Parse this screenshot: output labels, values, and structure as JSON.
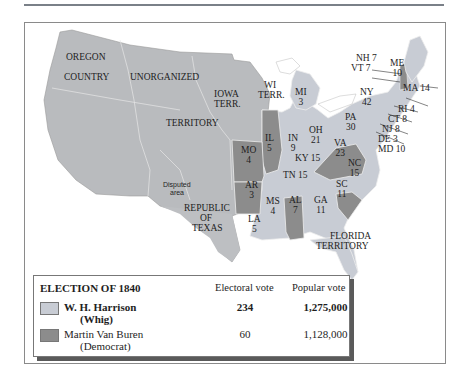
{
  "title": "ELECTION OF 1840",
  "colors": {
    "whig": "#c8ccd4",
    "democrat": "#8c8c8c",
    "territory": "#b9bbbe",
    "water": "#ffffff",
    "border": "#e8e8e8"
  },
  "map_labels": {
    "oregon": "OREGON",
    "country": "COUNTRY",
    "unorganized": "UNORGANIZED",
    "territory": "TERRITORY",
    "iowa": "IOWA",
    "terr_iowa": "TERR.",
    "wi": "WI",
    "terr_wi": "TERR.",
    "disputed_1": "Disputed",
    "disputed_2": "area",
    "republic": "REPUBLIC",
    "of": "OF",
    "texas": "TEXAS",
    "florida": "FLORIDA",
    "florida_terr": "TERRITORY"
  },
  "states": [
    {
      "abbr": "MI",
      "votes": "3",
      "winner": "whig"
    },
    {
      "abbr": "IL",
      "votes": "5",
      "winner": "democrat"
    },
    {
      "abbr": "IN",
      "votes": "9",
      "winner": "whig"
    },
    {
      "abbr": "OH",
      "votes": "21",
      "winner": "whig"
    },
    {
      "abbr": "MO",
      "votes": "4",
      "winner": "democrat"
    },
    {
      "abbr": "KY",
      "votes": "15",
      "winner": "whig"
    },
    {
      "abbr": "AR",
      "votes": "3",
      "winner": "democrat"
    },
    {
      "abbr": "TN",
      "votes": "15",
      "winner": "whig"
    },
    {
      "abbr": "MS",
      "votes": "4",
      "winner": "whig"
    },
    {
      "abbr": "AL",
      "votes": "7",
      "winner": "democrat"
    },
    {
      "abbr": "GA",
      "votes": "11",
      "winner": "whig"
    },
    {
      "abbr": "LA",
      "votes": "5",
      "winner": "whig"
    },
    {
      "abbr": "SC",
      "votes": "11",
      "winner": "democrat"
    },
    {
      "abbr": "NC",
      "votes": "15",
      "winner": "whig"
    },
    {
      "abbr": "VA",
      "votes": "23",
      "winner": "democrat"
    },
    {
      "abbr": "PA",
      "votes": "30",
      "winner": "whig"
    },
    {
      "abbr": "NY",
      "votes": "42",
      "winner": "whig"
    },
    {
      "abbr": "ME",
      "votes": "10",
      "winner": "whig"
    },
    {
      "abbr": "NH",
      "votes": "7",
      "winner": "democrat"
    },
    {
      "abbr": "VT",
      "votes": "7",
      "winner": "whig"
    },
    {
      "abbr": "MA",
      "votes": "14",
      "winner": "whig"
    },
    {
      "abbr": "RI",
      "votes": "4",
      "winner": "whig"
    },
    {
      "abbr": "CT",
      "votes": "8",
      "winner": "whig"
    },
    {
      "abbr": "NJ",
      "votes": "8",
      "winner": "whig"
    },
    {
      "abbr": "DE",
      "votes": "3",
      "winner": "whig"
    },
    {
      "abbr": "MD",
      "votes": "10",
      "winner": "whig"
    }
  ],
  "state_text": {
    "MI": "MI",
    "MI_v": "3",
    "IL": "IL",
    "IL_v": "5",
    "IN": "IN",
    "IN_v": "9",
    "OH": "OH",
    "OH_v": "21",
    "MO": "MO",
    "MO_v": "4",
    "KY": "KY 15",
    "AR": "AR",
    "AR_v": "3",
    "TN": "TN 15",
    "MS": "MS",
    "MS_v": "4",
    "AL": "AL",
    "AL_v": "7",
    "GA": "GA",
    "GA_v": "11",
    "LA": "LA",
    "LA_v": "5",
    "SC": "SC",
    "SC_v": "11",
    "NC": "NC",
    "NC_v": "15",
    "VA": "VA",
    "VA_v": "23",
    "PA": "PA",
    "PA_v": "30",
    "NY": "NY",
    "NY_v": "42",
    "ME": "ME",
    "ME_v": "10",
    "NH": "NH 7",
    "VT": "VT 7",
    "MA": "MA 14",
    "RI": "RI 4",
    "CT": "CT 8",
    "NJ": "NJ 8",
    "DE": "DE 3",
    "MD": "MD 10"
  },
  "legend": {
    "title": "ELECTION OF 1840",
    "col_electoral": "Electoral vote",
    "col_popular": "Popular vote",
    "rows": [
      {
        "candidate": "W. H. Harrison",
        "party": "(Whig)",
        "electoral": "234",
        "popular": "1,275,000",
        "color": "#c8ccd4",
        "bold": true
      },
      {
        "candidate": "Martin Van Buren",
        "party": "(Democrat)",
        "electoral": "60",
        "popular": "1,128,000",
        "color": "#8c8c8c",
        "bold": false
      }
    ]
  }
}
